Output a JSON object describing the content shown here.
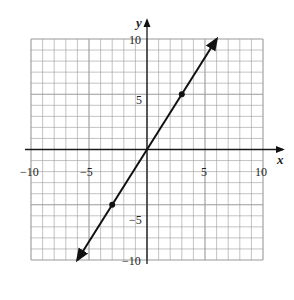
{
  "chart_data": {
    "type": "line",
    "title": "",
    "xlabel": "x",
    "ylabel": "y",
    "xlim": [
      -10,
      10
    ],
    "ylim": [
      -10,
      10
    ],
    "grid": true,
    "grid_step": 1,
    "major_step": 5,
    "x_ticks": [
      "-10",
      "-5",
      "5",
      "10"
    ],
    "y_ticks": [
      "10",
      "5",
      "-5",
      "-10"
    ],
    "series": [
      {
        "name": "y = (5/3)x",
        "equation": "y = 5x/3",
        "line_start": [
          -6,
          -10
        ],
        "line_end": [
          6,
          10
        ],
        "arrows": "both",
        "points": [
          {
            "x": -3,
            "y": -5
          },
          {
            "x": 3,
            "y": 5
          }
        ]
      }
    ],
    "legend": null
  },
  "labels": {
    "x_axis": "x",
    "y_axis": "y",
    "x_tick_neg10": "−10",
    "x_tick_neg5": "−5",
    "x_tick_5": "5",
    "x_tick_10": "10",
    "y_tick_10": "10",
    "y_tick_5": "5",
    "y_tick_neg5": "−5",
    "y_tick_neg10": "−10"
  },
  "colors": {
    "grid": "#9a9a9a",
    "axis": "#1a1a1a",
    "line": "#111111"
  }
}
